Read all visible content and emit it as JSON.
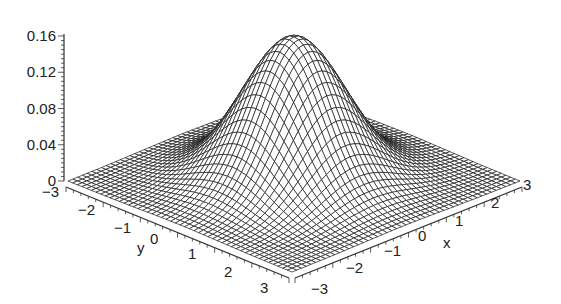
{
  "chart_data": {
    "type": "surface3d",
    "title": "",
    "function": "bivariate standard normal density f(x,y) = exp(-(x^2+y^2)/2) / (2*pi)",
    "xlabel": "x",
    "ylabel": "y",
    "zlabel": "",
    "xlim": [
      -3,
      3
    ],
    "ylim": [
      -3,
      3
    ],
    "zlim": [
      0,
      0.16
    ],
    "grid_resolution": 49,
    "peak": {
      "x": 0,
      "y": 0,
      "z": 0.159
    },
    "x_ticks": [
      "-3",
      "-2",
      "-1",
      "0",
      "1",
      "2",
      "3"
    ],
    "y_ticks": [
      "-3",
      "-2",
      "-1",
      "0",
      "1",
      "2",
      "3"
    ],
    "z_ticks": [
      "0",
      "0.04",
      "0.08",
      "0.12",
      "0.16"
    ],
    "colors": {
      "mesh": "#1a1a1a",
      "surface": "#ffffff",
      "axis": "#333333"
    }
  },
  "labels": {
    "x_axis": "x",
    "y_axis": "y"
  }
}
